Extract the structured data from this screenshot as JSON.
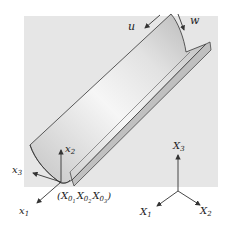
{
  "figure": {
    "type": "3D trough / half-cylinder shell diagram",
    "colors": {
      "background_panel": "#e6e6e6",
      "surface_light": "#f4f4f4",
      "surface_dark": "#b8b8b8",
      "outline": "#333333",
      "axes": "#333333"
    }
  },
  "labels": {
    "u": "u",
    "w": "w",
    "local_x1": "x",
    "local_x1_sub": "1",
    "local_x2": "x",
    "local_x2_sub": "2",
    "local_x3": "x",
    "local_x3_sub": "3",
    "origin_open": "(",
    "origin_X": "X",
    "origin_0": "0",
    "origin_sub1": "1",
    "origin_sub2": "2",
    "origin_sub3": "3",
    "origin_close": ")",
    "global_X1": "X",
    "global_X1_sub": "1",
    "global_X2": "X",
    "global_X2_sub": "2",
    "global_X3": "X",
    "global_X3_sub": "3"
  }
}
